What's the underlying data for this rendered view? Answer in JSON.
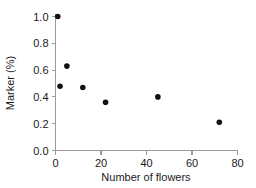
{
  "chart_data": {
    "type": "scatter",
    "title": "",
    "xlabel": "Number of flowers",
    "ylabel": "Marker (%)",
    "xlim": [
      0,
      80
    ],
    "ylim": [
      0.0,
      1.0
    ],
    "xticks": [
      0,
      20,
      40,
      60,
      80
    ],
    "xtick_labels": [
      "0",
      "20",
      "40",
      "60",
      "80"
    ],
    "yticks": [
      0.0,
      0.2,
      0.4,
      0.6,
      0.8,
      1.0
    ],
    "ytick_labels": [
      "0.0",
      "0.2",
      "0.4",
      "0.6",
      "0.8",
      "1.0"
    ],
    "grid": false,
    "legend": false,
    "marker_color": "#111111",
    "marker_shape": "circle",
    "axis_color": "#9a9a9a",
    "background": "#ffffff",
    "series": [
      {
        "name": "Marker vs flowers",
        "points": [
          {
            "x": 1,
            "y": 1.0
          },
          {
            "x": 2,
            "y": 0.48
          },
          {
            "x": 5,
            "y": 0.63
          },
          {
            "x": 12,
            "y": 0.47
          },
          {
            "x": 22,
            "y": 0.36
          },
          {
            "x": 45,
            "y": 0.4
          },
          {
            "x": 72,
            "y": 0.21
          }
        ]
      }
    ]
  }
}
